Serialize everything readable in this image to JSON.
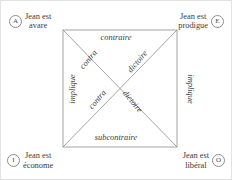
{
  "figure": {
    "kind": "square-of-opposition",
    "language": "fr"
  },
  "vertices": {
    "a": {
      "badge": "A",
      "line1": "Jean est",
      "line2": "avare"
    },
    "e": {
      "badge": "E",
      "line1": "Jean est",
      "line2": "prodigue"
    },
    "i": {
      "badge": "I",
      "line1": "Jean est",
      "line2": "économe"
    },
    "o": {
      "badge": "O",
      "line1": "Jean est",
      "line2": "libéral"
    }
  },
  "relations": {
    "top": "contraire",
    "bottom": "subcontraire",
    "left": "implique",
    "right": "implique",
    "diagonal_descending_part1": "contra",
    "diagonal_descending_part2": "dictoire",
    "diagonal_ascending_part1": "contra",
    "diagonal_ascending_part2": "dictoire"
  },
  "colors": {
    "line": "#8d8d8d",
    "text": "#3a3a3a",
    "frame": "#e2e2e2",
    "background": "#ffffff"
  }
}
